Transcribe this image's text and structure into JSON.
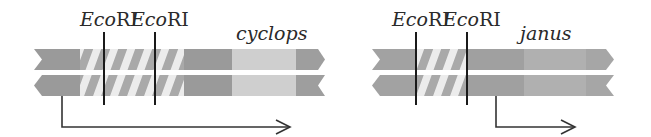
{
  "diagram": {
    "colors": {
      "dark_segment": "#9a9a9a",
      "mid_segment": "#acacac",
      "light_segment": "#cfcfcf",
      "stripe_light": "#ececec",
      "stripe_dark": "#a6a6a6",
      "marker_line": "#1a1a1a",
      "arrow": "#333333"
    },
    "constructs": [
      {
        "name": "cyclops",
        "gene_label": "cyclops",
        "sites": [
          {
            "label_italic": "Eco",
            "label_roman": "RI"
          },
          {
            "label_italic": "Eco",
            "label_roman": "RI"
          }
        ],
        "arrow": "long transcript arrow from left end rightwards"
      },
      {
        "name": "janus",
        "gene_label": "janus",
        "sites": [
          {
            "label_italic": "Eco",
            "label_roman": "RI"
          },
          {
            "label_italic": "Eco",
            "label_roman": "RI"
          }
        ],
        "arrow": "short transcript arrow starting after second site"
      }
    ]
  }
}
